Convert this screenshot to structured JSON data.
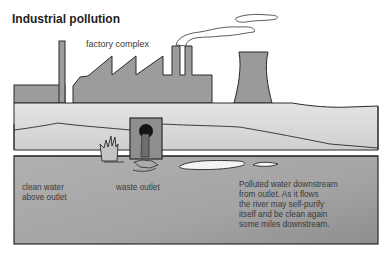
{
  "title": "Industrial pollution",
  "labels": {
    "factory": "factory complex",
    "clean_water": "clean water\nabove outlet",
    "waste_outlet": "waste outlet",
    "polluted": "Polluted water downstream\nfrom outlet. As it flows\nthe river may self-purify\nitself and be clean again\nsome miles downstream."
  },
  "colors": {
    "background": "#ffffff",
    "building_fill": "#9a9a9a",
    "bank_fill": "#d8d8d8",
    "water_fill": "#a8a8a8",
    "outline": "#2a2a2a",
    "text": "#333333"
  }
}
